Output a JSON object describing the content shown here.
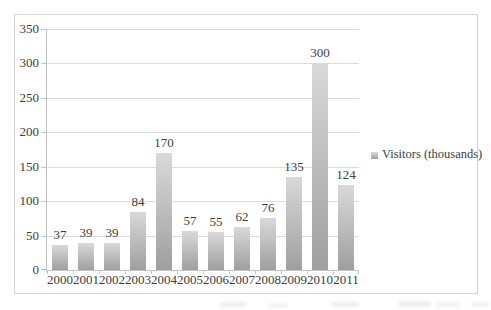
{
  "chart_data": {
    "type": "bar",
    "title": "",
    "categories": [
      "2000",
      "2001",
      "2002",
      "2003",
      "2004",
      "2005",
      "2006",
      "2007",
      "2008",
      "2009",
      "2010",
      "2011"
    ],
    "series": [
      {
        "name": "Visitors (thousands)",
        "values": [
          37,
          39,
          39,
          84,
          170,
          57,
          55,
          62,
          76,
          135,
          300,
          124
        ]
      }
    ],
    "xlabel": "",
    "ylabel": "",
    "ylim": [
      0,
      350
    ],
    "yticks": [
      0,
      50,
      100,
      150,
      200,
      250,
      300,
      350
    ],
    "grid": true,
    "data_labels": true,
    "legend": {
      "position": "right",
      "entries": [
        "Visitors (thousands)"
      ]
    },
    "colors": {
      "bar_top": "#d9d9d9",
      "bar_bottom": "#9f9f9f",
      "gridline": "#dcdcdc",
      "axis": "#c3c3c3",
      "frame_border": "#d4d4d4",
      "text": "#3d3d3d",
      "background": "#ffffff"
    }
  }
}
